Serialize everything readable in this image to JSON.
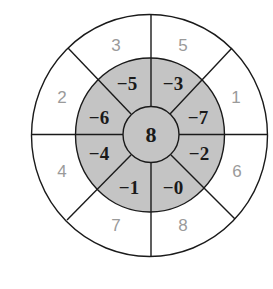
{
  "diagram": {
    "type": "concentric-ring-number-wheel",
    "colors": {
      "background": "#ffffff",
      "inner_ring_fill": "#c4c4c4",
      "center_fill": "#c4c4c4",
      "stroke": "#1a1a1a",
      "outer_label": "#9a9a9a",
      "inner_label": "#1a1a1a"
    },
    "center": {
      "value": "8"
    },
    "inner_ring": [
      {
        "position": "top-left",
        "value": "−5"
      },
      {
        "position": "top-right",
        "value": "−3"
      },
      {
        "position": "upper-right",
        "value": "−7"
      },
      {
        "position": "lower-right",
        "value": "−2"
      },
      {
        "position": "bottom-right",
        "value": "−0"
      },
      {
        "position": "bottom-left",
        "value": "−1"
      },
      {
        "position": "lower-left",
        "value": "−4"
      },
      {
        "position": "upper-left",
        "value": "−6"
      }
    ],
    "outer_ring": [
      {
        "position": "top-left",
        "value": "3"
      },
      {
        "position": "top-right",
        "value": "5"
      },
      {
        "position": "upper-right",
        "value": "1"
      },
      {
        "position": "lower-right",
        "value": "6"
      },
      {
        "position": "bottom-right",
        "value": "8"
      },
      {
        "position": "bottom-left",
        "value": "7"
      },
      {
        "position": "lower-left",
        "value": "4"
      },
      {
        "position": "upper-left",
        "value": "2"
      }
    ]
  }
}
